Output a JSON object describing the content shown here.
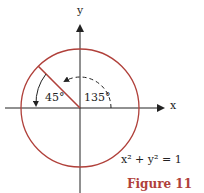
{
  "diagram": {
    "axis_x_label": "x",
    "axis_y_label": "y",
    "angle_small": "45°",
    "angle_large": "135°",
    "equation": "x² + y² = 1",
    "caption": "Figure 11",
    "colors": {
      "circle": "#b0403a",
      "axes": "#222222",
      "caption": "#b0403a"
    }
  }
}
